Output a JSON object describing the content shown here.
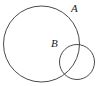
{
  "figure": {
    "kind": "venn-two-circle-diagram",
    "width": 99,
    "height": 86,
    "background_color": "#ffffff",
    "stroke_color": "#4a4a4a",
    "label_color": "#1a1a1a",
    "stroke_width": 1
  },
  "shapes": [
    {
      "id": "circle-a",
      "role": "large-circle",
      "cx": 41.5,
      "cy": 44,
      "r": 38,
      "label": "A"
    },
    {
      "id": "circle-b",
      "role": "small-circle",
      "cx": 77,
      "cy": 62,
      "r": 17.5,
      "label": "B"
    }
  ],
  "labels": {
    "a": {
      "text": "A",
      "x": 71,
      "y": 12
    },
    "b": {
      "text": "B",
      "x": 51,
      "y": 47
    }
  }
}
